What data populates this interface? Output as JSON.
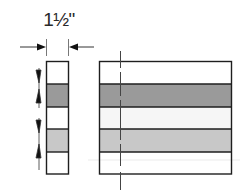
{
  "dimension": {
    "label": "1½\"",
    "arrow_y": 47
  },
  "colors": {
    "stroke": "#1e1e1e",
    "dark_band": "#9a9a9a",
    "light_band": "#c8c8c8",
    "white_band": "#ffffff"
  },
  "end_view": {
    "x": 46,
    "width": 23,
    "bands": [
      "white",
      "dark",
      "white",
      "light",
      "white"
    ]
  },
  "side_view": {
    "x": 99,
    "width": 133,
    "bands": [
      "white",
      "dark",
      "white",
      "light",
      "white"
    ]
  },
  "band_edges_y": [
    61,
    84,
    107,
    129,
    152,
    174
  ]
}
